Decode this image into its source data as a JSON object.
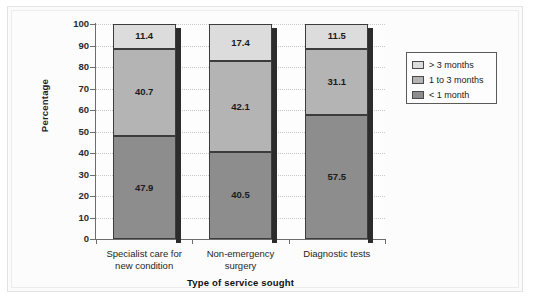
{
  "chart_data": {
    "type": "bar",
    "subtype": "stacked-bar-100",
    "title": "",
    "xlabel": "Type of service sought",
    "ylabel": "Percentage",
    "ylim": [
      0,
      100
    ],
    "ytick_step": 10,
    "yticks": [
      100,
      90,
      80,
      70,
      60,
      50,
      40,
      30,
      20,
      10,
      0
    ],
    "grid": true,
    "grid_style": "dotted-horizontal",
    "legend_position": "right",
    "categories": [
      "Specialist care for\nnew condition",
      "Non-emergency\nsurgery",
      "Diagnostic tests"
    ],
    "category_lines": [
      [
        "Specialist care for",
        "new condition"
      ],
      [
        "Non-emergency",
        "surgery"
      ],
      [
        "Diagnostic tests"
      ]
    ],
    "series": [
      {
        "name": "< 1 month",
        "color": "#8d8d8d",
        "values": [
          47.9,
          40.5,
          57.5
        ]
      },
      {
        "name": "1 to 3 months",
        "color": "#b4b4b4",
        "values": [
          40.7,
          42.1,
          31.1
        ]
      },
      {
        "name": "> 3 months",
        "color": "#dcdcdc",
        "values": [
          11.4,
          17.4,
          11.5
        ]
      }
    ],
    "stack_order_bottom_to_top": [
      "< 1 month",
      "1 to 3 months",
      "> 3 months"
    ],
    "data_labels": [
      [
        "47.9",
        "40.7",
        "11.4"
      ],
      [
        "40.5",
        "42.1",
        "17.4"
      ],
      [
        "57.5",
        "31.1",
        "11.5"
      ]
    ]
  },
  "legend": {
    "items": [
      {
        "label": "> 3 months",
        "color": "#dcdcdc"
      },
      {
        "label": "1 to 3 months",
        "color": "#b4b4b4"
      },
      {
        "label": "< 1 month",
        "color": "#8d8d8d"
      }
    ]
  },
  "axes": {
    "y_title": "Percentage",
    "x_title": "Type of service sought",
    "y_tick_labels": [
      "100",
      "90",
      "80",
      "70",
      "60",
      "50",
      "40",
      "30",
      "20",
      "10",
      "0"
    ]
  }
}
